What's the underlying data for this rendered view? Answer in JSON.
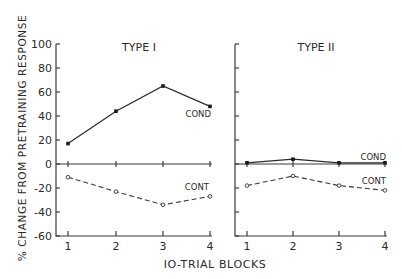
{
  "chart_data": {
    "type": "line",
    "ylabel": "% CHANGE FROM PRETRAINING RESPONSE",
    "xlabel": "IO-TRIAL BLOCKS",
    "ylim": [
      -60,
      100
    ],
    "yticks": [
      100,
      80,
      60,
      40,
      20,
      0,
      -20,
      -40,
      -60
    ],
    "grid": false,
    "panels": [
      {
        "title": "TYPE I",
        "categories": [
          "1",
          "2",
          "3",
          "4"
        ],
        "series": [
          {
            "name": "COND",
            "style": "solid",
            "marker": "filled",
            "values": [
              17,
              44,
              65,
              48
            ]
          },
          {
            "name": "CONT",
            "style": "dashed",
            "marker": "open",
            "values": [
              -11,
              -23,
              -34,
              -27
            ]
          }
        ]
      },
      {
        "title": "TYPE II",
        "categories": [
          "1",
          "2",
          "3",
          "4"
        ],
        "series": [
          {
            "name": "COND",
            "style": "solid",
            "marker": "filled",
            "values": [
              1,
              4,
              1,
              1
            ]
          },
          {
            "name": "CONT",
            "style": "dashed",
            "marker": "open",
            "values": [
              -18,
              -10,
              -18,
              -22
            ]
          }
        ]
      }
    ]
  }
}
